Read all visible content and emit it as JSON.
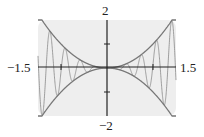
{
  "chart_data": {
    "type": "line",
    "title": "",
    "xlabel": "",
    "ylabel": "",
    "xlim": [
      -1.5,
      1.5
    ],
    "ylim": [
      -2,
      2
    ],
    "grid": false,
    "legend": null,
    "tick_labels": {
      "x_min": "−1.5",
      "x_max": "1.5",
      "y_max": "2",
      "y_min": "−2"
    },
    "x_ticks": [
      -1,
      1
    ],
    "y_ticks": [
      -1,
      1
    ],
    "series": [
      {
        "name": "upper envelope",
        "expression": "y = x^2",
        "color": "#777777"
      },
      {
        "name": "lower envelope",
        "expression": "y = -x^2",
        "color": "#777777"
      },
      {
        "name": "oscillating function",
        "expression": "y = x^2 sin(19x) (approx.)",
        "color": "#888888",
        "touch_points_upper_approx_x": [
          -1.35,
          -1.0,
          -0.67,
          -0.41,
          0.41,
          0.67,
          1.0,
          1.35
        ]
      }
    ],
    "background": "#eeeeee",
    "axis_color": "#222222"
  }
}
